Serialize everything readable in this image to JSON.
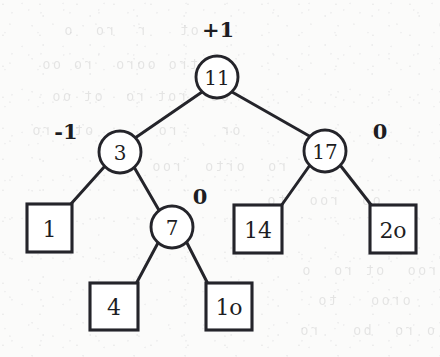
{
  "diagram": {
    "type": "binary-search-tree",
    "background_color": "#fbfbfa",
    "ink_color": "#24242a",
    "node_fill": "#ffffff"
  },
  "nodes": [
    {
      "id": "n11",
      "label": "11",
      "shape": "circle",
      "cx": 217,
      "cy": 77,
      "r": 21,
      "balance_factor": "+1",
      "bf_x": 218,
      "bf_y": 29
    },
    {
      "id": "n3",
      "label": "3",
      "shape": "circle",
      "cx": 120,
      "cy": 152,
      "r": 21,
      "balance_factor": "-1",
      "bf_x": 66,
      "bf_y": 131
    },
    {
      "id": "n17",
      "label": "17",
      "shape": "circle",
      "cx": 325,
      "cy": 151,
      "r": 21,
      "balance_factor": "0",
      "bf_x": 380,
      "bf_y": 131
    },
    {
      "id": "n7",
      "label": "7",
      "shape": "circle",
      "cx": 172,
      "cy": 227,
      "r": 21,
      "balance_factor": "0",
      "bf_x": 200,
      "bf_y": 196
    }
  ],
  "leaves": [
    {
      "id": "l1",
      "label": "1",
      "shape": "square",
      "x": 27,
      "y": 204,
      "w": 45,
      "h": 48
    },
    {
      "id": "l14",
      "label": "14",
      "shape": "square",
      "x": 234,
      "y": 205,
      "w": 48,
      "h": 48
    },
    {
      "id": "l20",
      "label": "2o",
      "shape": "square",
      "x": 370,
      "y": 205,
      "w": 46,
      "h": 48
    },
    {
      "id": "l4",
      "label": "4",
      "shape": "square",
      "x": 90,
      "y": 283,
      "w": 48,
      "h": 47
    },
    {
      "id": "l10",
      "label": "1o",
      "shape": "square",
      "x": 206,
      "y": 283,
      "w": 46,
      "h": 47
    }
  ],
  "edges": [
    {
      "id": "e-11-3",
      "from": "n11",
      "to": "n3",
      "x1": 202,
      "y1": 92,
      "x2": 135,
      "y2": 138
    },
    {
      "id": "e-11-17",
      "from": "n11",
      "to": "n17",
      "x1": 232,
      "y1": 92,
      "x2": 311,
      "y2": 137
    },
    {
      "id": "e-3-1",
      "from": "n3",
      "to": "l1",
      "x1": 105,
      "y1": 166,
      "x2": 70,
      "y2": 205
    },
    {
      "id": "e-3-7",
      "from": "n3",
      "to": "n7",
      "x1": 134,
      "y1": 167,
      "x2": 160,
      "y2": 212
    },
    {
      "id": "e-7-4",
      "from": "n7",
      "to": "l4",
      "x1": 159,
      "y1": 241,
      "x2": 136,
      "y2": 284
    },
    {
      "id": "e-7-10",
      "from": "n7",
      "to": "l10",
      "x1": 186,
      "y1": 241,
      "x2": 208,
      "y2": 284
    },
    {
      "id": "e-17-14",
      "from": "n17",
      "to": "l14",
      "x1": 310,
      "y1": 165,
      "x2": 281,
      "y2": 206
    },
    {
      "id": "e-17-20",
      "from": "n17",
      "to": "l20",
      "x1": 340,
      "y1": 165,
      "x2": 372,
      "y2": 206
    }
  ],
  "background_ghost_text": {
    "note": "faint illegible bleed-through from the reverse side of the scanned page",
    "lines": [
      {
        "text": "o  ot   r  ro  o",
        "x": 62,
        "y": 22
      },
      {
        "text": "otro ooro  ro oo",
        "x": 40,
        "y": 56
      },
      {
        "text": "oo  rot ro  ot oo",
        "x": 50,
        "y": 88
      },
      {
        "text": "or    ro      ot  ro",
        "x": 30,
        "y": 122
      },
      {
        "text": "ro  orto  roo",
        "x": 150,
        "y": 158
      },
      {
        "text": "oo  roo  to",
        "x": 265,
        "y": 192
      },
      {
        "text": "roo  ot ro  o",
        "x": 300,
        "y": 262
      },
      {
        "text": "oroo   to",
        "x": 316,
        "y": 292
      },
      {
        "text": "o ro  bo   ro",
        "x": 298,
        "y": 322
      }
    ]
  }
}
